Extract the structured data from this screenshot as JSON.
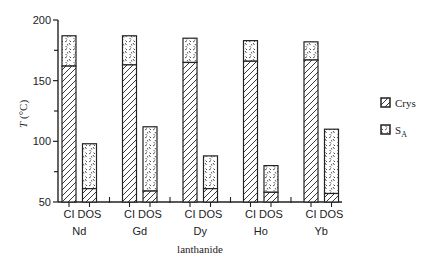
{
  "chart_data": {
    "type": "bar",
    "stacked": true,
    "title": "",
    "xlabel": "lanthanide",
    "ylabel": "T (°C)",
    "ylim": [
      50,
      200
    ],
    "yticks": [
      50,
      100,
      150,
      200
    ],
    "grid": false,
    "legend_position": "right",
    "groups": [
      "Nd",
      "Gd",
      "Dy",
      "Ho",
      "Yb"
    ],
    "subcategories": [
      "CI",
      "DOS"
    ],
    "series": [
      {
        "name": "Crys",
        "pattern": "diagonal-hatch",
        "description": "crystal phase up to melting into SA",
        "CI": [
          162,
          163,
          165,
          166,
          167
        ],
        "DOS": [
          61,
          59,
          61,
          58,
          57
        ]
      },
      {
        "name": "SA",
        "pattern": "zigzag-dash",
        "description": "smectic A range, top = clearing point",
        "CI": [
          187,
          187,
          185,
          183,
          182
        ],
        "DOS": [
          98,
          112,
          88,
          80,
          110
        ]
      }
    ],
    "bars": [
      {
        "group": "Nd",
        "sub": "CI",
        "crys_top": 162,
        "sa_top": 187
      },
      {
        "group": "Nd",
        "sub": "DOS",
        "crys_top": 61,
        "sa_top": 98
      },
      {
        "group": "Gd",
        "sub": "CI",
        "crys_top": 163,
        "sa_top": 187
      },
      {
        "group": "Gd",
        "sub": "DOS",
        "crys_top": 59,
        "sa_top": 112
      },
      {
        "group": "Dy",
        "sub": "CI",
        "crys_top": 165,
        "sa_top": 185
      },
      {
        "group": "Dy",
        "sub": "DOS",
        "crys_top": 61,
        "sa_top": 88
      },
      {
        "group": "Ho",
        "sub": "CI",
        "crys_top": 166,
        "sa_top": 183
      },
      {
        "group": "Ho",
        "sub": "DOS",
        "crys_top": 58,
        "sa_top": 80
      },
      {
        "group": "Yb",
        "sub": "CI",
        "crys_top": 167,
        "sa_top": 182
      },
      {
        "group": "Yb",
        "sub": "DOS",
        "crys_top": 57,
        "sa_top": 110
      }
    ]
  },
  "axis": {
    "ylabel_italic": "T",
    "ylabel_unit": "(°C)",
    "xlabel": "lanthanide"
  },
  "legend": {
    "items": [
      {
        "label": "Crys",
        "sub": ""
      },
      {
        "label": "S",
        "sub": "A"
      }
    ]
  }
}
